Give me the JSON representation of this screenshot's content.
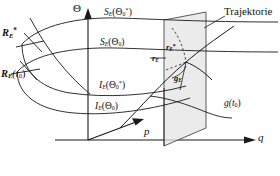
{
  "figure": {
    "type": "technical-diagram",
    "language": "de"
  },
  "axes": {
    "vertical": {
      "name": "theta-axis",
      "label": "Θ"
    },
    "depth": {
      "name": "p-axis",
      "label": "p"
    },
    "horizontal": {
      "name": "q-axis",
      "label": "q"
    }
  },
  "curves": {
    "upper_surface_star": {
      "label_main": "S",
      "label_sub": "E",
      "label_arg_open": "(Θ",
      "label_arg_sub": "0",
      "label_arg_sup": "*",
      "label_arg_close": ")"
    },
    "upper_surface": {
      "label_main": "S",
      "label_sub": "E",
      "label_arg_open": "(Θ",
      "label_arg_sub": "0",
      "label_arg_sup": "",
      "label_arg_close": ")"
    },
    "lower_curve_star": {
      "label_main": "I",
      "label_sub": "E",
      "label_arg_open": "(Θ",
      "label_arg_sub": "0",
      "label_arg_sup": "*",
      "label_arg_close": ")"
    },
    "lower_curve": {
      "label_main": "I",
      "label_sub": "E",
      "label_arg_open": "(Θ",
      "label_arg_sub": "0",
      "label_arg_sup": "",
      "label_arg_close": ")"
    }
  },
  "labels": {
    "R_star": {
      "main": "R",
      "sub": "E",
      "sup": "*"
    },
    "R_t0": {
      "main": "R",
      "sub": "E",
      "arg": "(t",
      "arg_sub": "0",
      "arg_close": ")"
    },
    "r_vec_star": {
      "main": "r",
      "sub": "E",
      "sup": "*"
    },
    "r_vec": {
      "main": "r",
      "sub": "E",
      "sup": ""
    },
    "g_vec": {
      "main": "g",
      "sub": "E"
    },
    "g_t0": {
      "main": "g",
      "arg": "(t",
      "arg_sub": "0",
      "arg_close": ")"
    },
    "trajectory": {
      "text": "Trajektorie"
    }
  },
  "colors": {
    "stroke": "#1a1a1a",
    "plane_fill": "#e2e2e2",
    "plane_stroke": "#555555",
    "background": "#ffffff"
  }
}
